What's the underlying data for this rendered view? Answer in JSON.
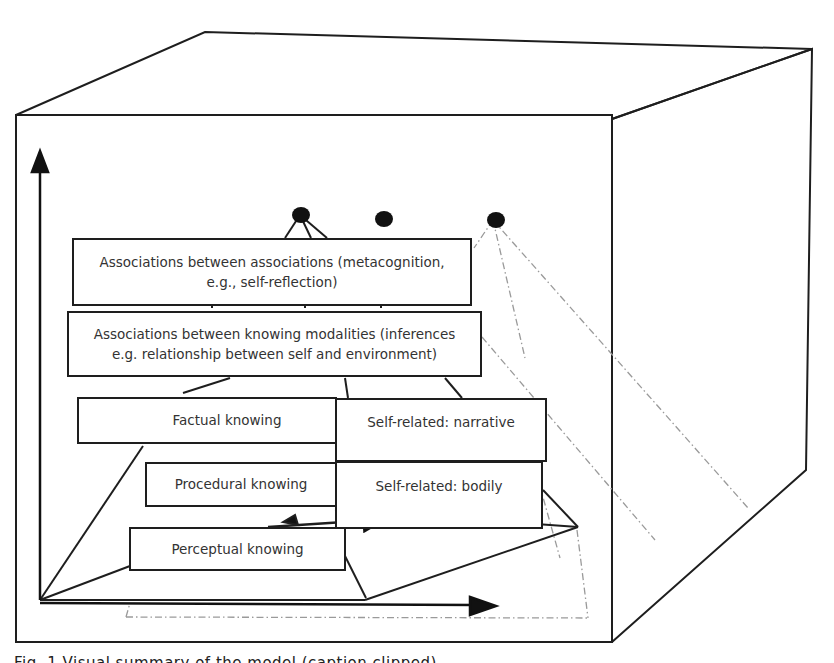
{
  "diagram": {
    "type": "3d-cube-knowledge-hierarchy",
    "colors": {
      "stroke": "#1e1e1e",
      "dashed": "#9a9a9a",
      "text": "#333333",
      "background": "#ffffff"
    },
    "levels": [
      {
        "id": "metacognition",
        "label_line1": "Associations between associations (metacognition,",
        "label_line2": "e.g., self-reflection)"
      },
      {
        "id": "inferences",
        "label_line1": "Associations between knowing modalities (inferences",
        "label_line2": "e.g. relationship between self and environment)"
      },
      {
        "id": "factual",
        "label": "Factual knowing"
      },
      {
        "id": "self-narrative",
        "label": "Self-related: narrative"
      },
      {
        "id": "procedural",
        "label": "Procedural knowing"
      },
      {
        "id": "self-bodily",
        "label": "Self-related: bodily"
      },
      {
        "id": "perceptual",
        "label": "Perceptual knowing"
      }
    ],
    "nodes": [
      {
        "id": "dot-1",
        "style": "solid-connected"
      },
      {
        "id": "dot-2",
        "style": "solid-floating"
      },
      {
        "id": "dot-3",
        "style": "dash-dot-connected"
      }
    ],
    "axes": [
      {
        "id": "vertical-axis",
        "direction": "up"
      },
      {
        "id": "horizontal-axis",
        "direction": "right"
      }
    ],
    "caption": "Fig. 1 Visual summary of the model (caption clipped)"
  }
}
